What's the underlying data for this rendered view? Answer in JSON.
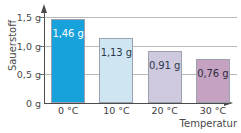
{
  "chart_data": {
    "type": "bar",
    "title": "",
    "xlabel": "Temperatur",
    "ylabel": "Sauerstoff",
    "categories": [
      "0 °C",
      "10 °C",
      "20 °C",
      "30 °C"
    ],
    "values": [
      1.46,
      1.13,
      0.91,
      0.76
    ],
    "value_labels": [
      "1,46 g",
      "1,13 g",
      "0,91 g",
      "0,76 g"
    ],
    "ylim": [
      0,
      1.62
    ],
    "y_ticks": [
      0,
      0.5,
      1.0,
      1.5
    ],
    "y_tick_labels": [
      "0 g",
      "0,5 g",
      "1,0 g",
      "1,5 g"
    ],
    "grid": true,
    "legend": "none",
    "bar_colors": [
      "#18a2dc",
      "#cfe5f2",
      "#cfc9df",
      "#c6a2c2"
    ],
    "bar_label_colors": [
      "#ffffff",
      "#2b3a4a",
      "#2b3a4a",
      "#2b2b3a"
    ],
    "bar_border_color": "#9aa2ad",
    "grid_color": "#b9b9b9",
    "axis_color": "#4b4b4b"
  }
}
